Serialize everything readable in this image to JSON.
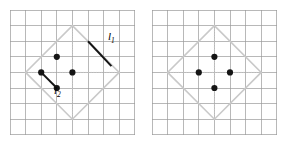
{
  "figure": {
    "type": "geometry-diagram",
    "background_color": "#ffffff",
    "grid_color": "#9a9a9a",
    "diamond_color": "#c9c9c9",
    "dot_color": "#151515",
    "segment_color": "#151515",
    "label_color": "#000000"
  },
  "panels": [
    {
      "id": "left-panel",
      "name": "left-grid-panel",
      "grid": {
        "columns": 8,
        "rows": 8,
        "origin_x": 10,
        "origin_y": 10,
        "cell_size": 15.6
      },
      "diamond": {
        "vertices": [
          [
            4,
            1
          ],
          [
            7,
            4
          ],
          [
            4,
            7
          ],
          [
            1,
            4
          ]
        ]
      },
      "diagonals": [
        [
          [
            1,
            4
          ],
          [
            7,
            4
          ]
        ],
        [
          [
            4,
            1
          ],
          [
            4,
            7
          ]
        ]
      ],
      "dots": [
        [
          3,
          3
        ],
        [
          4,
          4
        ],
        [
          2,
          4
        ],
        [
          3,
          5
        ]
      ],
      "segments": [
        {
          "id": "l1",
          "from": [
            5,
            2
          ],
          "to": [
            6.5,
            3.6
          ]
        },
        {
          "id": "l2",
          "from": [
            2,
            4
          ],
          "to": [
            3,
            5
          ]
        }
      ],
      "labels": [
        {
          "id": "l1-label",
          "text": "l",
          "sub": "1",
          "x": 108,
          "y": 31
        },
        {
          "id": "l2-label",
          "text": "l",
          "sub": "2",
          "x": 54,
          "y": 85
        }
      ]
    },
    {
      "id": "right-panel",
      "name": "right-grid-panel",
      "grid": {
        "columns": 8,
        "rows": 8,
        "origin_x": 152,
        "origin_y": 10,
        "cell_size": 15.6
      },
      "diamond": {
        "vertices": [
          [
            4,
            1
          ],
          [
            7,
            4
          ],
          [
            4,
            7
          ],
          [
            1,
            4
          ]
        ]
      },
      "diagonals": [
        [
          [
            1,
            4
          ],
          [
            7,
            4
          ]
        ],
        [
          [
            4,
            1
          ],
          [
            4,
            7
          ]
        ]
      ],
      "dots": [
        [
          4,
          3
        ],
        [
          5,
          4
        ],
        [
          3,
          4
        ],
        [
          4,
          5
        ]
      ],
      "segments": [],
      "labels": []
    }
  ]
}
